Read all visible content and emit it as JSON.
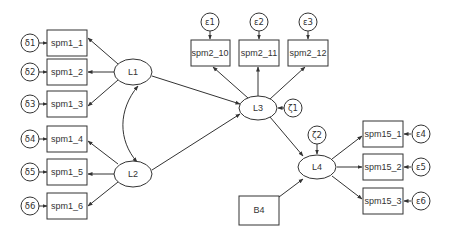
{
  "diagram": {
    "type": "structural-equation-model",
    "latent": [
      {
        "id": "L1",
        "label": "L1"
      },
      {
        "id": "L2",
        "label": "L2"
      },
      {
        "id": "L3",
        "label": "L3"
      },
      {
        "id": "L4",
        "label": "L4"
      }
    ],
    "observed": [
      {
        "id": "spm1_1",
        "label": "spm1_1"
      },
      {
        "id": "spm1_2",
        "label": "spm1_2"
      },
      {
        "id": "spm1_3",
        "label": "spm1_3"
      },
      {
        "id": "spm1_4",
        "label": "spm1_4"
      },
      {
        "id": "spm1_5",
        "label": "spm1_5"
      },
      {
        "id": "spm1_6",
        "label": "spm1_6"
      },
      {
        "id": "spm2_10",
        "label": "spm2_10"
      },
      {
        "id": "spm2_11",
        "label": "spm2_11"
      },
      {
        "id": "spm2_12",
        "label": "spm2_12"
      },
      {
        "id": "spm15_1",
        "label": "spm15_1"
      },
      {
        "id": "spm15_2",
        "label": "spm15_2"
      },
      {
        "id": "spm15_3",
        "label": "spm15_3"
      },
      {
        "id": "B4",
        "label": "B4"
      }
    ],
    "errors": [
      {
        "id": "d1",
        "label": "δ1"
      },
      {
        "id": "d2",
        "label": "δ2"
      },
      {
        "id": "d3",
        "label": "δ3"
      },
      {
        "id": "d4",
        "label": "δ4"
      },
      {
        "id": "d5",
        "label": "δ5"
      },
      {
        "id": "d6",
        "label": "δ6"
      },
      {
        "id": "e1",
        "label": "ε1"
      },
      {
        "id": "e2",
        "label": "ε2"
      },
      {
        "id": "e3",
        "label": "ε3"
      },
      {
        "id": "e4",
        "label": "ε4"
      },
      {
        "id": "e5",
        "label": "ε5"
      },
      {
        "id": "e6",
        "label": "ε6"
      },
      {
        "id": "z1",
        "label": "ζ1"
      },
      {
        "id": "z2",
        "label": "ζ2"
      }
    ],
    "paths": [
      [
        "L1",
        "spm1_1"
      ],
      [
        "L1",
        "spm1_2"
      ],
      [
        "L1",
        "spm1_3"
      ],
      [
        "L2",
        "spm1_4"
      ],
      [
        "L2",
        "spm1_5"
      ],
      [
        "L2",
        "spm1_6"
      ],
      [
        "L1",
        "L3"
      ],
      [
        "L2",
        "L3"
      ],
      [
        "L3",
        "spm2_10"
      ],
      [
        "L3",
        "spm2_11"
      ],
      [
        "L3",
        "spm2_12"
      ],
      [
        "L3",
        "L4"
      ],
      [
        "B4",
        "L4"
      ],
      [
        "L4",
        "spm15_1"
      ],
      [
        "L4",
        "spm15_2"
      ],
      [
        "L4",
        "spm15_3"
      ],
      [
        "d1",
        "spm1_1"
      ],
      [
        "d2",
        "spm1_2"
      ],
      [
        "d3",
        "spm1_3"
      ],
      [
        "d4",
        "spm1_4"
      ],
      [
        "d5",
        "spm1_5"
      ],
      [
        "d6",
        "spm1_6"
      ],
      [
        "e1",
        "spm2_10"
      ],
      [
        "e2",
        "spm2_11"
      ],
      [
        "e3",
        "spm2_12"
      ],
      [
        "e4",
        "spm15_1"
      ],
      [
        "e5",
        "spm15_2"
      ],
      [
        "e6",
        "spm15_3"
      ],
      [
        "z1",
        "L3"
      ],
      [
        "z2",
        "L4"
      ]
    ],
    "covariances": [
      [
        "L1",
        "L2"
      ]
    ]
  }
}
